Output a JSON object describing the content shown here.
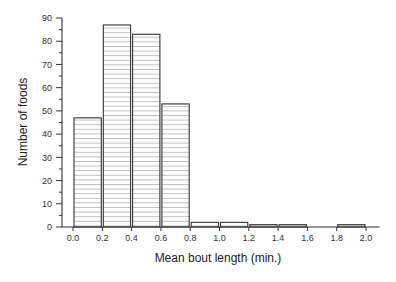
{
  "chart_data": {
    "type": "bar",
    "subtype": "histogram",
    "title": "",
    "xlabel": "Mean bout length (min.)",
    "ylabel": "Number of foods",
    "bins": [
      {
        "start": 0.0,
        "end": 0.2,
        "value": 47
      },
      {
        "start": 0.2,
        "end": 0.4,
        "value": 87
      },
      {
        "start": 0.4,
        "end": 0.6,
        "value": 83
      },
      {
        "start": 0.6,
        "end": 0.8,
        "value": 53
      },
      {
        "start": 0.8,
        "end": 1.0,
        "value": 2
      },
      {
        "start": 1.0,
        "end": 1.2,
        "value": 2
      },
      {
        "start": 1.2,
        "end": 1.4,
        "value": 1
      },
      {
        "start": 1.4,
        "end": 1.6,
        "value": 1
      },
      {
        "start": 1.6,
        "end": 1.8,
        "value": 0
      },
      {
        "start": 1.8,
        "end": 2.0,
        "value": 1
      }
    ],
    "categories": [
      "0.0-0.2",
      "0.2-0.4",
      "0.4-0.6",
      "0.6-0.8",
      "0.8-1.0",
      "1.0-1.2",
      "1.2-1.4",
      "1.4-1.6",
      "1.6-1.8",
      "1.8-2.0"
    ],
    "values": [
      47,
      87,
      83,
      53,
      2,
      2,
      1,
      1,
      0,
      1
    ],
    "xticks": [
      "0.0",
      "0.2",
      "0.4",
      "0.6",
      "0.8",
      "1.0",
      "1.2",
      "1.4",
      "1.6",
      "1.8",
      "2.0"
    ],
    "yticks": [
      "0",
      "10",
      "20",
      "30",
      "40",
      "50",
      "60",
      "70",
      "80",
      "90"
    ],
    "xlim": [
      0.0,
      2.1
    ],
    "ylim": [
      0,
      90
    ],
    "grid": false,
    "legend": null,
    "bar_fill": "horizontal-hatch",
    "colors": {
      "bar_edge": "#333333",
      "hatch": "#aaaaaa",
      "axis": "#333333"
    }
  }
}
